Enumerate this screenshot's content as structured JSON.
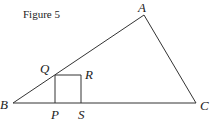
{
  "figure": {
    "caption": "Figure 5",
    "line_color": "#333333",
    "points": {
      "A": {
        "label": "A",
        "x": 144,
        "y": 15
      },
      "B": {
        "label": "B",
        "x": 13,
        "y": 103
      },
      "C": {
        "label": "C",
        "x": 196,
        "y": 103
      },
      "Q": {
        "label": "Q",
        "x": 55,
        "y": 75
      },
      "R": {
        "label": "R",
        "x": 81,
        "y": 75
      },
      "P": {
        "label": "P",
        "x": 55,
        "y": 103
      },
      "S": {
        "label": "S",
        "x": 81,
        "y": 103
      }
    },
    "segments": [
      [
        "A",
        "B"
      ],
      [
        "B",
        "C"
      ],
      [
        "C",
        "A"
      ],
      [
        "Q",
        "R"
      ],
      [
        "R",
        "S"
      ],
      [
        "Q",
        "P"
      ]
    ]
  }
}
